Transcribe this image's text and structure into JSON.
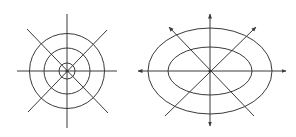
{
  "style": {
    "background": "#ffffff",
    "stroke_color": "#3a3a3a",
    "stroke_width": 1
  },
  "figures": [
    {
      "name": "circular-field-pattern",
      "center": [
        67,
        71
      ],
      "circles": [
        {
          "r": 37.5
        },
        {
          "r": 23
        },
        {
          "r": 8
        }
      ],
      "center_dot_r": 1.6,
      "lines": [
        {
          "name": "horizontal-axis",
          "x1": 17,
          "y1": 71,
          "x2": 117,
          "y2": 71,
          "arrow_start": false,
          "arrow_end": false
        },
        {
          "name": "vertical-axis",
          "x1": 67,
          "y1": 14,
          "x2": 67,
          "y2": 128,
          "arrow_start": false,
          "arrow_end": false
        },
        {
          "name": "diagonal-nw-se",
          "x1": 27,
          "y1": 29,
          "x2": 108,
          "y2": 113,
          "arrow_start": false,
          "arrow_end": false
        },
        {
          "name": "diagonal-ne-sw",
          "x1": 107,
          "y1": 30,
          "x2": 28,
          "y2": 112,
          "arrow_start": false,
          "arrow_end": false
        }
      ]
    },
    {
      "name": "elliptical-field-pattern",
      "center": [
        210,
        71
      ],
      "ellipses": [
        {
          "rx": 62,
          "ry": 43
        },
        {
          "rx": 42,
          "ry": 24
        }
      ],
      "center_dot_r": 1.6,
      "lines": [
        {
          "name": "horizontal-axis",
          "x1": 138,
          "y1": 71,
          "x2": 286,
          "y2": 71,
          "arrow_start": true,
          "arrow_end": true
        },
        {
          "name": "vertical-axis",
          "x1": 210,
          "y1": 14,
          "x2": 210,
          "y2": 126,
          "arrow_start": true,
          "arrow_end": true
        },
        {
          "name": "diagonal-nw-se",
          "x1": 169,
          "y1": 27,
          "x2": 254,
          "y2": 116,
          "arrow_start": true,
          "arrow_end": false
        },
        {
          "name": "diagonal-ne-sw",
          "x1": 256,
          "y1": 27,
          "x2": 165,
          "y2": 116,
          "arrow_start": true,
          "arrow_end": false
        }
      ]
    }
  ]
}
